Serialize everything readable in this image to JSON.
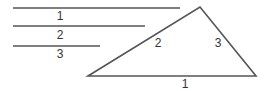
{
  "diagram": {
    "stroke_color": "#555555",
    "segments": [
      {
        "label": "1",
        "x1": 13,
        "x2": 180,
        "y": 8,
        "label_x": 60,
        "label_y": 20
      },
      {
        "label": "2",
        "x1": 13,
        "x2": 145,
        "y": 26,
        "label_x": 60,
        "label_y": 39
      },
      {
        "label": "3",
        "x1": 13,
        "x2": 100,
        "y": 46,
        "label_x": 60,
        "label_y": 58
      }
    ],
    "triangle": {
      "vertices": [
        [
          88,
          76
        ],
        [
          200,
          7
        ],
        [
          256,
          76
        ]
      ],
      "side_labels": [
        {
          "label": "1",
          "x": 185,
          "y": 88
        },
        {
          "label": "2",
          "x": 158,
          "y": 47
        },
        {
          "label": "3",
          "x": 218,
          "y": 47
        }
      ]
    }
  }
}
